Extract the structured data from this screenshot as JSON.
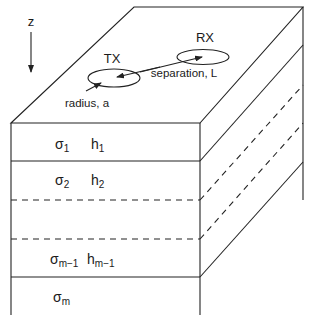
{
  "diagram": {
    "type": "layered-earth-model",
    "axis": {
      "label": "z"
    },
    "surface": {
      "transmitter": {
        "label": "TX"
      },
      "receiver": {
        "label": "RX"
      },
      "radius_label": "radius, a",
      "separation_label": "separation, L"
    },
    "layers": [
      {
        "sigma": "σ",
        "sigma_sub": "1",
        "h": "h",
        "h_sub": "1"
      },
      {
        "sigma": "σ",
        "sigma_sub": "2",
        "h": "h",
        "h_sub": "2"
      },
      {
        "sigma": "",
        "sigma_sub": "",
        "h": "",
        "h_sub": ""
      },
      {
        "sigma": "σ",
        "sigma_sub": "m−1",
        "h": "h",
        "h_sub": "m−1"
      },
      {
        "sigma": "σ",
        "sigma_sub": "m",
        "h": "",
        "h_sub": ""
      }
    ],
    "colors": {
      "line": "#222222",
      "background": "#ffffff"
    }
  }
}
